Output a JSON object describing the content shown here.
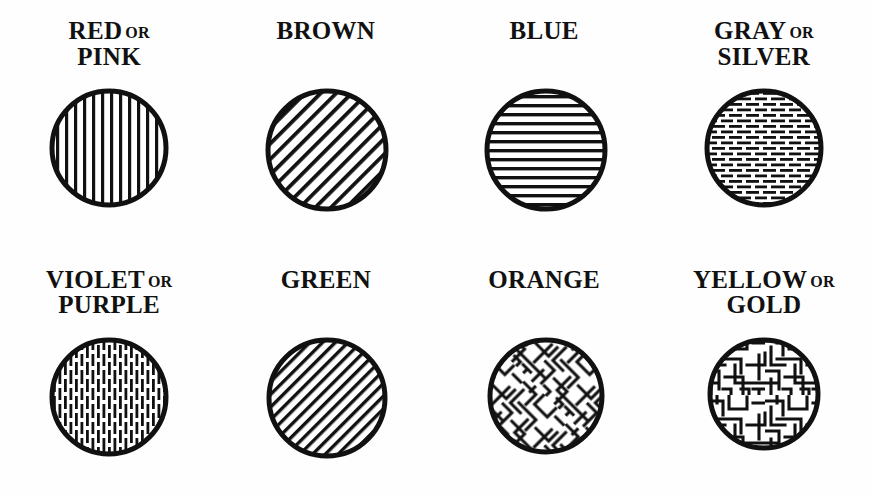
{
  "page": {
    "background_color": "#fefefe",
    "ink_color": "#111111",
    "columns": 4,
    "rows": 2
  },
  "legend": {
    "conjunction": "OR",
    "items": [
      {
        "id": "red-pink",
        "primary": "RED",
        "conjunction": "OR",
        "secondary": "PINK",
        "pattern": "vertical-solid-lines",
        "pattern_label": "vertical solid lines"
      },
      {
        "id": "brown",
        "primary": "BROWN",
        "conjunction": "",
        "secondary": "",
        "pattern": "diagonal-solid-lines",
        "pattern_label": "diagonal solid lines"
      },
      {
        "id": "blue",
        "primary": "BLUE",
        "conjunction": "",
        "secondary": "",
        "pattern": "horizontal-solid-lines",
        "pattern_label": "horizontal solid lines"
      },
      {
        "id": "gray-silver",
        "primary": "GRAY",
        "conjunction": "OR",
        "secondary": "SILVER",
        "pattern": "horizontal-dashed-lines",
        "pattern_label": "horizontal broken lines"
      },
      {
        "id": "violet-purple",
        "primary": "VIOLET",
        "conjunction": "OR",
        "secondary": "PURPLE",
        "pattern": "vertical-dashed-lines",
        "pattern_label": "vertical broken lines"
      },
      {
        "id": "green",
        "primary": "GREEN",
        "conjunction": "",
        "secondary": "",
        "pattern": "diagonal-solid-lines-fine",
        "pattern_label": "fine diagonal solid lines"
      },
      {
        "id": "orange",
        "primary": "ORANGE",
        "conjunction": "",
        "secondary": "",
        "pattern": "diagonal-maze",
        "pattern_label": "diagonal maze texture"
      },
      {
        "id": "yellow-gold",
        "primary": "YELLOW",
        "conjunction": "OR",
        "secondary": "GOLD",
        "pattern": "orthogonal-maze",
        "pattern_label": "orthogonal maze texture"
      }
    ]
  }
}
